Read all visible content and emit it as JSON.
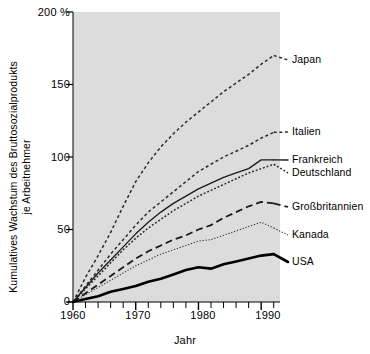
{
  "chart_data": {
    "type": "line",
    "title": "",
    "xlabel": "Jahr",
    "ylabel": "Kumulatives Wachstum des Bruttosozialprodukts je Arbeitnehmer",
    "ylabel_line1": "Kumulatives Wachstum des Bruttosozialprodukts",
    "ylabel_line2": "je Arbeitnehmer",
    "y_unit": "%",
    "xlim": [
      1960,
      1993
    ],
    "ylim": [
      0,
      200
    ],
    "grid": false,
    "legend_position": "right-inline",
    "y_ticks": [
      {
        "value": 200,
        "label": "200 %"
      },
      {
        "value": 150,
        "label": "150"
      },
      {
        "value": 100,
        "label": "100"
      },
      {
        "value": 50,
        "label": "50"
      },
      {
        "value": 0,
        "label": "0"
      }
    ],
    "x_ticks_labeled": [
      {
        "value": 1960,
        "label": "1960"
      },
      {
        "value": 1970,
        "label": "1970"
      },
      {
        "value": 1980,
        "label": "1980"
      },
      {
        "value": 1990,
        "label": "1990"
      }
    ],
    "x_minor_tick_step": 2,
    "x": [
      1960,
      1962,
      1964,
      1966,
      1968,
      1970,
      1972,
      1974,
      1976,
      1978,
      1980,
      1982,
      1984,
      1986,
      1988,
      1990,
      1992
    ],
    "series": [
      {
        "name": "Japan",
        "label": "Japan",
        "style": "dashed-fine",
        "color": "#2b2b2b",
        "values": [
          0,
          17,
          32,
          48,
          66,
          83,
          96,
          107,
          116,
          124,
          131,
          138,
          145,
          151,
          157,
          164,
          170
        ]
      },
      {
        "name": "Italien",
        "label": "Italien",
        "style": "dashed-fine",
        "color": "#2b2b2b",
        "values": [
          0,
          11,
          22,
          33,
          43,
          53,
          62,
          69,
          76,
          83,
          90,
          95,
          100,
          104,
          108,
          113,
          117
        ]
      },
      {
        "name": "Frankreich",
        "label": "Frankreich",
        "style": "solid-thin",
        "color": "#1a1a1a",
        "values": [
          0,
          10,
          20,
          29,
          38,
          47,
          55,
          62,
          68,
          73,
          78,
          82,
          86,
          89,
          92,
          98,
          98
        ]
      },
      {
        "name": "Deutschland",
        "label": "Deutschland",
        "style": "dotted-dense",
        "color": "#2b2b2b",
        "values": [
          0,
          9,
          18,
          27,
          36,
          44,
          51,
          57,
          63,
          68,
          73,
          77,
          81,
          85,
          89,
          92,
          95
        ]
      },
      {
        "name": "Großbritannien",
        "label": "Großbritannien",
        "style": "dashed-long",
        "color": "#1a1a1a",
        "values": [
          0,
          6,
          12,
          18,
          24,
          30,
          35,
          39,
          43,
          46,
          50,
          53,
          58,
          62,
          66,
          69,
          68
        ]
      },
      {
        "name": "Kanada",
        "label": "Kanada",
        "style": "dotted-fine",
        "color": "#2b2b2b",
        "values": [
          0,
          5,
          10,
          15,
          20,
          25,
          29,
          33,
          36,
          39,
          42,
          43,
          46,
          49,
          52,
          55,
          51
        ]
      },
      {
        "name": "USA",
        "label": "USA",
        "style": "solid-thick",
        "color": "#000000",
        "values": [
          0,
          2,
          4,
          7,
          9,
          11,
          14,
          16,
          19,
          22,
          24,
          23,
          26,
          28,
          30,
          32,
          33
        ]
      }
    ],
    "colors": {
      "plot_background": "#dcdcdc",
      "axis": "#000000",
      "text": "#000000"
    }
  }
}
